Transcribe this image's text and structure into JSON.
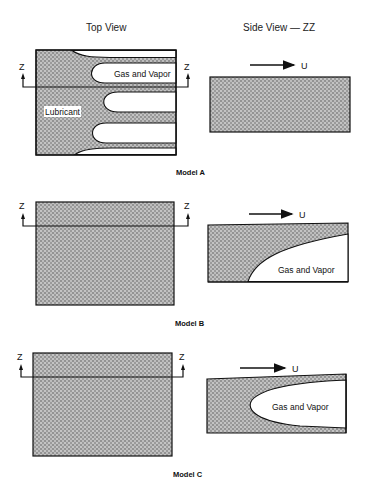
{
  "headers": {
    "top_view": "Top View",
    "side_view": "Side View — ZZ"
  },
  "section_marker": "Z",
  "velocity_label": "U",
  "models": [
    {
      "name": "Model A",
      "top_view": {
        "labels": [
          "Gas and Vapor",
          "Lubricant"
        ],
        "cavities": 3
      },
      "side_view": {
        "gas_label": "",
        "shape": "fully filled lubricant film"
      }
    },
    {
      "name": "Model B",
      "top_view": {
        "labels": [],
        "cavities": 0
      },
      "side_view": {
        "gas_label": "Gas and Vapor",
        "shape": "cavity attached to bottom surface"
      }
    },
    {
      "name": "Model C",
      "top_view": {
        "labels": [],
        "cavities": 0
      },
      "side_view": {
        "gas_label": "Gas and Vapor",
        "shape": "cavity in middle of film"
      }
    }
  ],
  "colors": {
    "lubricant_fill": "#9a9a9a",
    "outline": "#111111",
    "background": "#ffffff"
  }
}
